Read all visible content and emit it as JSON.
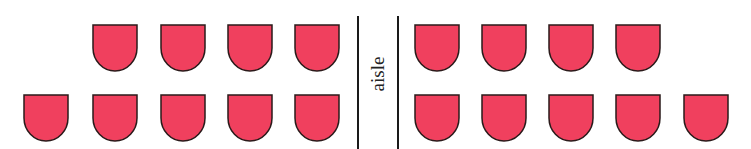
{
  "diagram": {
    "aisle_label": "aisle",
    "seat_color": "#f0405e",
    "seat_outline": "#2a1a1a",
    "left_section": {
      "row_front": {
        "seats": 4
      },
      "row_back": {
        "seats": 5
      }
    },
    "right_section": {
      "row_front": {
        "seats": 4
      },
      "row_back": {
        "seats": 5
      }
    },
    "total_seats": 18
  }
}
